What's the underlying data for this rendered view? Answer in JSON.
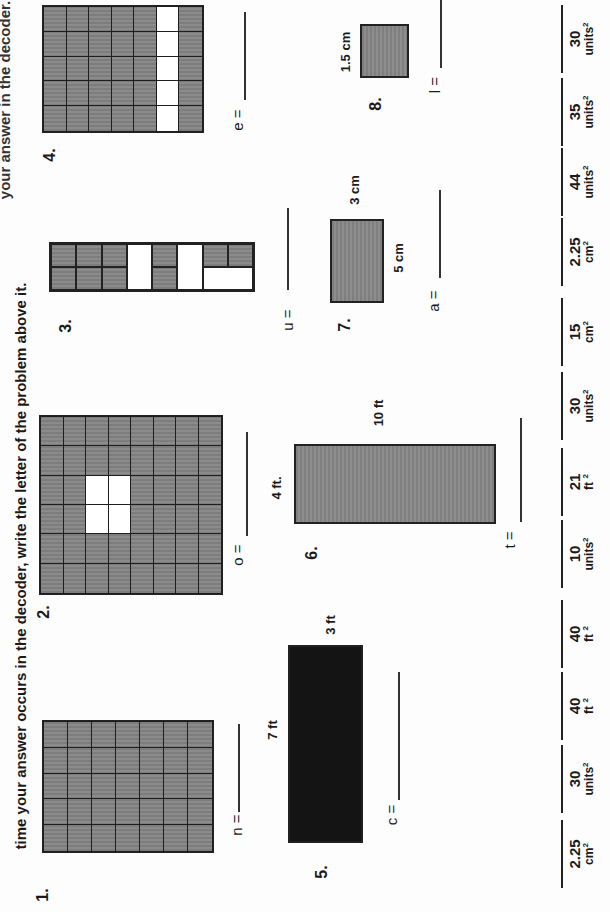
{
  "instructions": {
    "line1_partial": "your answer in the decoder. Each",
    "line2": "time your answer occurs in the decoder, write the letter of the problem above it."
  },
  "problems": [
    {
      "number": "1.",
      "letter": "n",
      "type": "grid",
      "cols": 7,
      "rows": 5,
      "white_cells": [],
      "answer_label": "n ="
    },
    {
      "number": "2.",
      "letter": "o",
      "type": "grid",
      "cols": 8,
      "rows": 6,
      "white_cells": [
        [
          2,
          2
        ],
        [
          3,
          2
        ],
        [
          2,
          3
        ],
        [
          3,
          3
        ]
      ],
      "answer_label": "o ="
    },
    {
      "number": "3.",
      "letter": "u",
      "type": "grid",
      "cols": 8,
      "rows": 2,
      "answer_label": "u ="
    },
    {
      "number": "4.",
      "letter": "e",
      "type": "grid",
      "cols": 7,
      "rows": 5,
      "white_column": 5,
      "answer_label": "e ="
    },
    {
      "number": "5.",
      "letter": "c",
      "type": "rectangle",
      "length": "7 ft",
      "width": "3 ft",
      "answer_label": "c ="
    },
    {
      "number": "6.",
      "letter": "t",
      "type": "rectangle",
      "length": "10 ft",
      "width": "4 ft.",
      "answer_label": "t ="
    },
    {
      "number": "7.",
      "letter": "a",
      "type": "rectangle",
      "length": "5 cm",
      "width": "3 cm",
      "answer_label": "a ="
    },
    {
      "number": "8.",
      "letter": "l",
      "type": "square",
      "side": "1.5 cm",
      "answer_label": "l ="
    }
  ],
  "decoder": [
    {
      "value": "2.25",
      "unit": "cm",
      "exp": "2"
    },
    {
      "value": "30",
      "unit": "units",
      "exp": "2"
    },
    {
      "value": "40",
      "unit": "ft ",
      "exp": "2"
    },
    {
      "value": "40",
      "unit": "ft ",
      "exp": "2"
    },
    {
      "value": "10",
      "unit": "units",
      "exp": "2"
    },
    {
      "value": "21",
      "unit": "ft ",
      "exp": "2"
    },
    {
      "value": "30",
      "unit": "units",
      "exp": "2"
    },
    {
      "value": "15",
      "unit": "cm",
      "exp": "2"
    },
    {
      "value": "2.25",
      "unit": "cm",
      "exp": "2"
    },
    {
      "value": "44",
      "unit": "units",
      "exp": "2"
    },
    {
      "value": "35",
      "unit": "units",
      "exp": "2"
    },
    {
      "value": "30",
      "unit": "units",
      "exp": "2"
    }
  ]
}
